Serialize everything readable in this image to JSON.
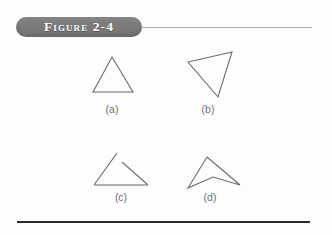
{
  "figure": {
    "badge_label": "Figure 2-4",
    "badge_color": "#7b7b7b",
    "badge_text_color": "#ffffff",
    "rule_color": "#a8a8a8",
    "bottom_rule_color": "#2b2b2b"
  },
  "stroke": {
    "color": "#6b6b6b",
    "width": 1.1
  },
  "shapes": [
    {
      "id": "shape-a",
      "label": "(a)",
      "kind": "triangle",
      "closed": true,
      "points": "112,57 133,92 93,92"
    },
    {
      "id": "shape-b",
      "label": "(b)",
      "kind": "triangle",
      "closed": true,
      "points": "232,52 218,97 188,62"
    },
    {
      "id": "shape-c",
      "label": "(c)",
      "kind": "open-figure",
      "closed": false,
      "stroke1": "94,185 117,153",
      "stroke2": "122,162 148,185",
      "stroke3": "94,185 148,185"
    },
    {
      "id": "shape-d",
      "label": "(d)",
      "kind": "concave-quadrilateral",
      "closed": true,
      "points": "207,157 240,185 213,177 188,188"
    }
  ]
}
